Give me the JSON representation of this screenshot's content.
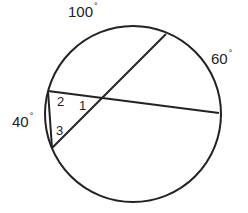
{
  "diagram": {
    "type": "circle-with-chords",
    "stroke_color": "#222222",
    "background": "#ffffff",
    "circle": {
      "cx": 133,
      "cy": 114,
      "r": 88
    },
    "points": {
      "A": {
        "x": 48,
        "y": 91
      },
      "B": {
        "x": 52,
        "y": 148
      },
      "C": {
        "x": 166,
        "y": 34
      },
      "D": {
        "x": 219,
        "y": 113
      },
      "E": {
        "x": 104,
        "y": 98
      }
    },
    "segments": [
      {
        "from": "A",
        "to": "D"
      },
      {
        "from": "B",
        "to": "C"
      },
      {
        "from": "A",
        "to": "B"
      }
    ],
    "arc_labels": [
      {
        "text": "100",
        "unit": "°",
        "x": 68,
        "y": 4
      },
      {
        "text": "60",
        "unit": "°",
        "x": 211,
        "y": 51
      },
      {
        "text": "40",
        "unit": "°",
        "x": 12,
        "y": 114
      }
    ],
    "angle_labels": [
      {
        "text": "1",
        "x": 79,
        "y": 99
      },
      {
        "text": "2",
        "x": 57,
        "y": 95
      },
      {
        "text": "3",
        "x": 56,
        "y": 124
      }
    ]
  }
}
